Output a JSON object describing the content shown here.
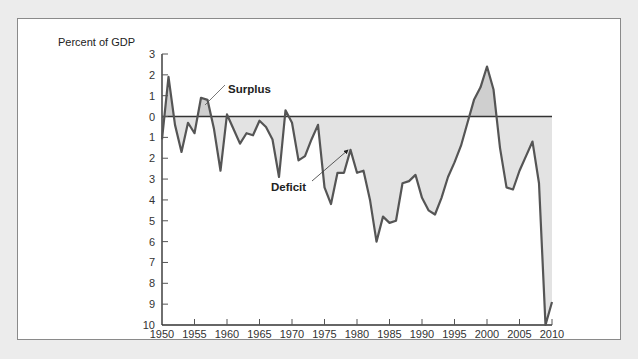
{
  "chart_data": {
    "type": "area",
    "title": "",
    "ylabel": "Percent of GDP",
    "xlabel": "",
    "ylim": [
      -10,
      3
    ],
    "xlim": [
      1950,
      2010
    ],
    "grid": false,
    "legend": "none",
    "y_tick_labels": [
      "3",
      "2",
      "1",
      "0",
      "1",
      "2",
      "3",
      "4",
      "5",
      "6",
      "7",
      "8",
      "9",
      "10"
    ],
    "y_tick_values": [
      3,
      2,
      1,
      0,
      -1,
      -2,
      -3,
      -4,
      -5,
      -6,
      -7,
      -8,
      -9,
      -10
    ],
    "x_tick_labels": [
      "1950",
      "1955",
      "1960",
      "1965",
      "1970",
      "1975",
      "1980",
      "1985",
      "1990",
      "1995",
      "2000",
      "2005",
      "2010"
    ],
    "annotations": [
      {
        "text": "Surplus",
        "points_to": "positive area near 1957"
      },
      {
        "text": "Deficit",
        "points_to": "negative area near 1979"
      }
    ],
    "x": [
      1950,
      1951,
      1952,
      1953,
      1954,
      1955,
      1956,
      1957,
      1958,
      1959,
      1960,
      1961,
      1962,
      1963,
      1964,
      1965,
      1966,
      1967,
      1968,
      1969,
      1970,
      1971,
      1972,
      1973,
      1974,
      1975,
      1976,
      1977,
      1978,
      1979,
      1980,
      1981,
      1982,
      1983,
      1984,
      1985,
      1986,
      1987,
      1988,
      1989,
      1990,
      1991,
      1992,
      1993,
      1994,
      1995,
      1996,
      1997,
      1998,
      1999,
      2000,
      2001,
      2002,
      2003,
      2004,
      2005,
      2006,
      2007,
      2008,
      2009,
      2010
    ],
    "series": [
      {
        "name": "Federal budget surplus/deficit (% of GDP)",
        "values": [
          -1.1,
          1.9,
          -0.4,
          -1.7,
          -0.3,
          -0.8,
          0.9,
          0.8,
          -0.6,
          -2.6,
          0.1,
          -0.6,
          -1.3,
          -0.8,
          -0.9,
          -0.2,
          -0.5,
          -1.1,
          -2.9,
          0.3,
          -0.3,
          -2.1,
          -1.9,
          -1.1,
          -0.4,
          -3.4,
          -4.2,
          -2.7,
          -2.7,
          -1.6,
          -2.7,
          -2.6,
          -4.0,
          -6.0,
          -4.8,
          -5.1,
          -5.0,
          -3.2,
          -3.1,
          -2.8,
          -3.9,
          -4.5,
          -4.7,
          -3.9,
          -2.9,
          -2.2,
          -1.4,
          -0.3,
          0.8,
          1.4,
          2.4,
          1.3,
          -1.5,
          -3.4,
          -3.5,
          -2.6,
          -1.9,
          -1.2,
          -3.2,
          -10.0,
          -8.9
        ]
      }
    ],
    "colors": {
      "line": "#555555",
      "fill_surplus": "#cfcfcf",
      "fill_deficit": "#e3e3e3",
      "axis": "#333333"
    }
  },
  "labels": {
    "y_axis_title": "Percent of GDP",
    "surplus": "Surplus",
    "deficit": "Deficit"
  }
}
